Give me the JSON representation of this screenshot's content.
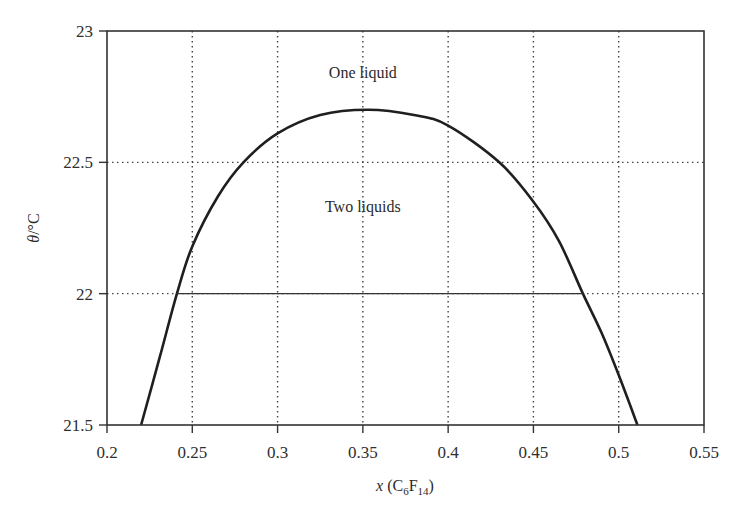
{
  "chart_data": {
    "type": "line",
    "title": "",
    "xlabel": "x (C6F14)",
    "xlabel_parts": {
      "var": "x",
      "open": " (C",
      "sub1": "6",
      "mid": "F",
      "sub2": "14",
      "close": ")"
    },
    "ylabel": "θ/°C",
    "xlim": [
      0.2,
      0.55
    ],
    "ylim": [
      21.5,
      23
    ],
    "x_ticks": [
      0.2,
      0.25,
      0.3,
      0.35,
      0.4,
      0.45,
      0.5,
      0.55
    ],
    "x_tick_labels": [
      "0.2",
      "0.25",
      "0.3",
      "0.35",
      "0.4",
      "0.45",
      "0.5",
      "0.55"
    ],
    "y_ticks": [
      21.5,
      22,
      22.5,
      23
    ],
    "y_tick_labels": [
      "21.5",
      "22",
      "22.5",
      "23"
    ],
    "grid": "dotted",
    "legend": null,
    "series": [
      {
        "name": "Coexistence curve",
        "x": [
          0.22,
          0.231,
          0.241,
          0.25,
          0.265,
          0.28,
          0.3,
          0.325,
          0.353,
          0.38,
          0.4,
          0.43,
          0.45,
          0.465,
          0.479,
          0.49,
          0.5,
          0.511
        ],
        "y": [
          21.5,
          21.76,
          22.0,
          22.18,
          22.37,
          22.5,
          22.61,
          22.68,
          22.7,
          22.68,
          22.64,
          22.5,
          22.35,
          22.2,
          22.0,
          21.85,
          21.69,
          21.5
        ]
      },
      {
        "name": "Tie line at 22 °C",
        "x": [
          0.241,
          0.479
        ],
        "y": [
          22.0,
          22.0
        ]
      }
    ],
    "annotations": [
      {
        "text": "One liquid",
        "x": 0.35,
        "y": 22.85
      },
      {
        "text": "Two liquids",
        "x": 0.35,
        "y": 22.4
      }
    ]
  }
}
